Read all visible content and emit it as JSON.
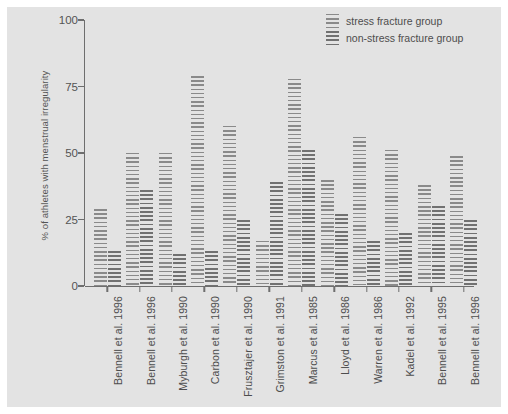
{
  "chart_data": {
    "type": "bar",
    "title": "",
    "xlabel": "",
    "ylabel": "% of athletes with menstrual irregularity",
    "ylim": [
      0,
      100
    ],
    "yticks": [
      0,
      25,
      50,
      75,
      100
    ],
    "grid": false,
    "legend_position": "top-right",
    "categories": [
      "Bennell et al. 1996",
      "Bennell et al. 1996",
      "Myburgh et al. 1990",
      "Carbon et al. 1990",
      "Frusztajer et al. 1990",
      "Grimston et al. 1991",
      "Marcus et al. 1985",
      "Lloyd et al. 1986",
      "Warren et al. 1986",
      "Kadel et al. 1992",
      "Bennell et al. 1995",
      "Bennell et al. 1996"
    ],
    "series": [
      {
        "name": "stress fracture group",
        "values": [
          29,
          50,
          50,
          79,
          60,
          17,
          78,
          40,
          56,
          51,
          38,
          49
        ]
      },
      {
        "name": "non-stress fracture group",
        "values": [
          13,
          36,
          12,
          13,
          25,
          39,
          51,
          27,
          17,
          20,
          30,
          25
        ]
      }
    ]
  },
  "legend": {
    "items": [
      {
        "label": "stress fracture group"
      },
      {
        "label": "non-stress fracture group"
      }
    ]
  },
  "axes": {
    "y_label": "% of athletes with menstrual irregularity",
    "y_ticks": [
      "100",
      "75",
      "50",
      "25",
      "0"
    ]
  },
  "colors": {
    "panel_background": "#e3e3e3",
    "figure_background": "#ffffff",
    "axis": "#6e6e6e",
    "text": "#4d4d4d",
    "series1_hatch": "#8a8a8a",
    "series2_hatch": "#717171"
  }
}
